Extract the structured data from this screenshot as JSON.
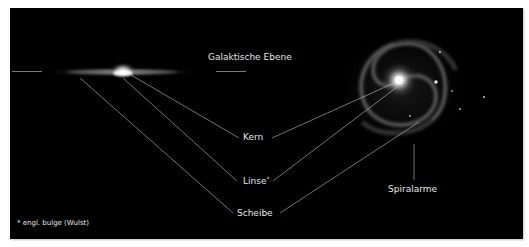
{
  "diagram": {
    "title_label": "Galaktische Ebene",
    "labels": {
      "core": "Kern",
      "bulge": "Linse",
      "bulge_marker": "*",
      "disk": "Scheibe",
      "spiral_arms": "Spiralarme"
    },
    "footnote": "* engl. bulge (Wulst)",
    "views": {
      "edge_on": "edge-on-galaxy",
      "face_on": "face-on-spiral-galaxy"
    },
    "colors": {
      "background": "#000000",
      "page": "#ffffff",
      "text": "#e6e6e6",
      "leader_lines": "#bfbfbf"
    }
  }
}
